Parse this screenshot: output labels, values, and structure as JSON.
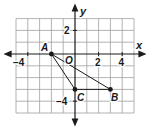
{
  "diagram": {
    "type": "coordinate-plane-triangle",
    "grid": {
      "x_min": -5,
      "x_max": 5,
      "y_min": -5,
      "y_max": 3,
      "unit": 1
    },
    "axes": {
      "x_label": "x",
      "y_label": "y",
      "origin_label": "O"
    },
    "tick_labels": {
      "x": [
        {
          "value": -4,
          "text": "−4"
        },
        {
          "value": 2,
          "text": "2"
        },
        {
          "value": 4,
          "text": "4"
        }
      ],
      "y": [
        {
          "value": 2,
          "text": "2"
        },
        {
          "value": -4,
          "text": "−4"
        }
      ]
    },
    "points": [
      {
        "label": "A",
        "x": -2,
        "y": 0
      },
      {
        "label": "B",
        "x": 3,
        "y": -3
      },
      {
        "label": "C",
        "x": 0,
        "y": -3
      }
    ],
    "segments": [
      [
        "A",
        "B"
      ],
      [
        "B",
        "C"
      ],
      [
        "C",
        "A"
      ]
    ],
    "colors": {
      "grid": "#9a9a9a",
      "axis": "#1a1a1a",
      "line": "#1a1a1a"
    }
  }
}
